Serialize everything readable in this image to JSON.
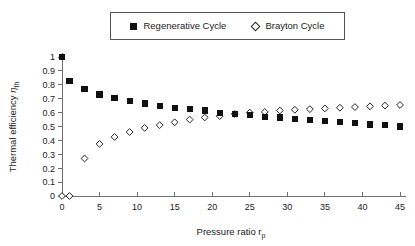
{
  "legend": {
    "entries": [
      {
        "marker": "filled-square",
        "label": "Regenerative Cycle"
      },
      {
        "marker": "open-diamond",
        "label": "Brayton Cycle"
      }
    ]
  },
  "axes": {
    "x_title_main": "Pressure ratio r",
    "x_title_sub": "p",
    "y_title_main": "Thermal efficiency ",
    "y_title_eta": "η",
    "y_title_sub": "th",
    "x_ticks": [
      "0",
      "5",
      "10",
      "15",
      "20",
      "25",
      "30",
      "35",
      "40",
      "45"
    ],
    "y_ticks": [
      "0",
      "0.1",
      "0.2",
      "0.3",
      "0.4",
      "0.5",
      "0.6",
      "0.7",
      "0.8",
      "0.9",
      "1"
    ]
  },
  "chart_data": {
    "type": "scatter",
    "title": "",
    "xlabel": "Pressure ratio r_p",
    "ylabel": "Thermal efficiency η_th",
    "xlim": [
      0,
      46
    ],
    "ylim": [
      0,
      1.05
    ],
    "xticks": [
      0,
      5,
      10,
      15,
      20,
      25,
      30,
      35,
      40,
      45
    ],
    "yticks": [
      0,
      0.1,
      0.2,
      0.3,
      0.4,
      0.5,
      0.6,
      0.7,
      0.8,
      0.9,
      1.0
    ],
    "grid": false,
    "legend_position": "top-center",
    "series": [
      {
        "name": "Regenerative Cycle",
        "marker": "filled-square",
        "color": "#111111",
        "x": [
          0,
          1,
          3,
          5,
          7,
          9,
          11,
          13,
          15,
          17,
          19,
          21,
          23,
          25,
          27,
          29,
          31,
          33,
          35,
          37,
          39,
          41,
          43,
          45
        ],
        "y": [
          1.0,
          0.83,
          0.77,
          0.73,
          0.705,
          0.685,
          0.665,
          0.65,
          0.635,
          0.625,
          0.615,
          0.6,
          0.59,
          0.58,
          0.57,
          0.565,
          0.555,
          0.545,
          0.54,
          0.53,
          0.525,
          0.515,
          0.51,
          0.5
        ]
      },
      {
        "name": "Brayton Cycle",
        "marker": "open-diamond",
        "color": "#222222",
        "x": [
          0,
          1,
          3,
          5,
          7,
          9,
          11,
          13,
          15,
          17,
          19,
          21,
          23,
          25,
          27,
          29,
          31,
          33,
          35,
          37,
          39,
          41,
          43,
          45
        ],
        "y": [
          0.0,
          0.0,
          0.27,
          0.375,
          0.425,
          0.46,
          0.49,
          0.51,
          0.53,
          0.55,
          0.565,
          0.575,
          0.59,
          0.6,
          0.605,
          0.615,
          0.62,
          0.625,
          0.63,
          0.635,
          0.64,
          0.645,
          0.65,
          0.655
        ]
      }
    ]
  }
}
